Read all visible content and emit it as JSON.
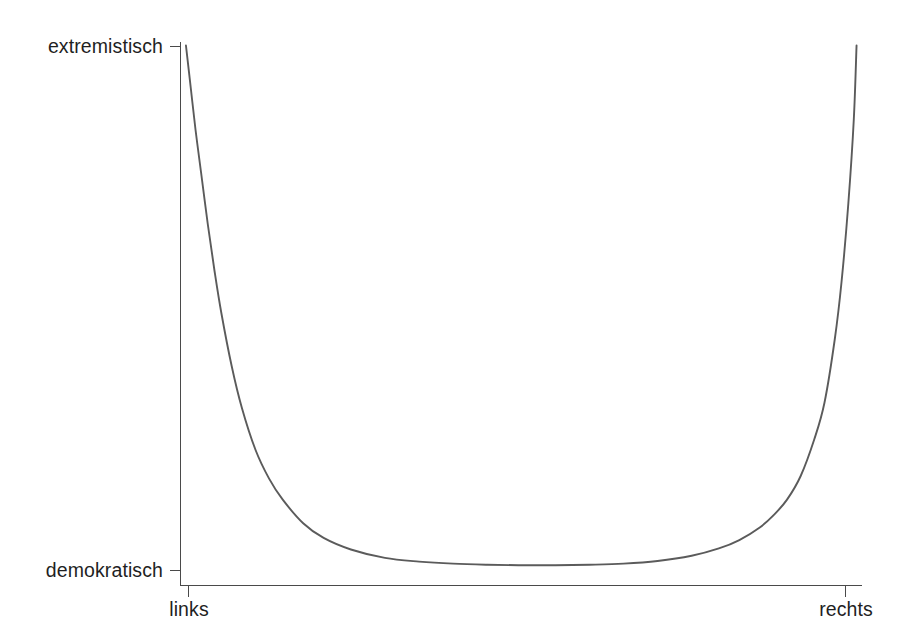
{
  "figure": {
    "background_color": "#ffffff",
    "curve_color": "#5b5b5b",
    "axis_color": "#4a4a4a",
    "text_color": "#1f1f1f"
  },
  "labels": {
    "y_top": "extremistisch",
    "y_bottom": "demokratisch",
    "x_left": "links",
    "x_right": "rechts"
  },
  "caption": {
    "text": ""
  },
  "chart_data": {
    "type": "line",
    "title": "",
    "subtitle": "",
    "xlabel": "",
    "ylabel": "",
    "grid": false,
    "legend": null,
    "legend_position": "none",
    "x_tick_labels": [
      "links",
      "rechts"
    ],
    "x_tick_positions": [
      0,
      100
    ],
    "y_tick_labels": [
      "demokratisch",
      "extremistisch"
    ],
    "y_tick_positions": [
      0,
      100
    ],
    "xlim": [
      0,
      100
    ],
    "ylim": [
      0,
      100
    ],
    "series": [
      {
        "name": "politische Einstellung",
        "x": [
          0.8,
          1.5,
          2.2,
          3.0,
          4.0,
          5.0,
          6.0,
          7.5,
          9.0,
          11.0,
          13.0,
          15.0,
          18.0,
          21.0,
          25.0,
          30.0,
          35.0,
          40.0,
          45.0,
          50.0,
          55.0,
          60.0,
          65.0,
          70.0,
          75.0,
          79.0,
          82.0,
          85.0,
          87.0,
          89.0,
          91.0,
          93.0,
          94.5,
          96.0,
          97.0,
          98.0,
          98.8,
          99.2
        ],
        "y": [
          100.0,
          92.0,
          84.0,
          76.0,
          66.0,
          57.0,
          49.0,
          39.0,
          31.0,
          23.0,
          17.5,
          13.5,
          9.0,
          6.2,
          4.0,
          2.4,
          1.7,
          1.3,
          1.1,
          1.0,
          1.0,
          1.1,
          1.3,
          1.8,
          2.8,
          4.2,
          5.8,
          8.2,
          10.5,
          13.5,
          18.0,
          25.0,
          32.0,
          44.0,
          55.0,
          70.0,
          86.0,
          100.0
        ]
      }
    ],
    "annotations": []
  }
}
